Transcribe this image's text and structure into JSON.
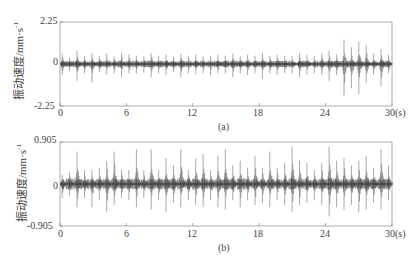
{
  "chart_data": [
    {
      "type": "line",
      "panel": "(a)",
      "caption": "(a)",
      "ylabel": "振动速度/mm·s",
      "ylabel_sup": "-1",
      "xlabel_unit": "(s)",
      "xlim": [
        0,
        30
      ],
      "ylim": [
        -2.25,
        2.25
      ],
      "xticks": [
        0,
        6,
        12,
        18,
        24,
        30
      ],
      "xtick_labels": [
        "0",
        "6",
        "12",
        "18",
        "24",
        "30(s)"
      ],
      "yticks": [
        -2.25,
        0,
        2.25
      ],
      "ytick_labels": [
        "-2.25",
        "0",
        "2.25"
      ],
      "grid": false,
      "description": "Periodic vibration velocity bursts about every 0.67 s; larger spikes near 25-29 s reaching about ±1.3",
      "bursts": {
        "period_s": 0.67,
        "start_s": 0.2,
        "up": [
          0.55,
          0.35,
          0.7,
          0.4,
          0.6,
          0.45,
          0.55,
          0.4,
          0.6,
          0.5,
          0.45,
          0.4,
          0.6,
          0.45,
          0.5,
          0.4,
          0.55,
          0.45,
          0.5,
          0.4,
          0.45,
          0.5,
          0.45,
          0.55,
          0.4,
          0.5,
          0.45,
          0.6,
          0.45,
          0.5,
          0.45,
          0.4,
          0.55,
          0.5,
          0.45,
          0.55,
          0.7,
          0.5,
          1.3,
          0.9,
          1.2,
          1.0,
          0.55,
          0.8,
          0.5
        ],
        "down": [
          0.6,
          0.4,
          0.9,
          0.5,
          1.0,
          0.45,
          0.55,
          0.5,
          0.7,
          0.5,
          0.5,
          0.45,
          0.7,
          0.5,
          0.6,
          0.45,
          0.7,
          0.5,
          0.55,
          0.5,
          0.6,
          0.5,
          0.5,
          0.7,
          0.5,
          0.6,
          0.5,
          0.8,
          0.5,
          0.6,
          0.5,
          0.5,
          0.7,
          0.55,
          0.5,
          0.6,
          0.9,
          0.6,
          1.7,
          1.3,
          1.6,
          1.0,
          0.6,
          1.2,
          0.5
        ],
        "noise": 0.12
      }
    },
    {
      "type": "line",
      "panel": "(b)",
      "caption": "(b)",
      "ylabel": "振动速度/mm·s",
      "ylabel_sup": "-1",
      "xlabel_unit": "(s)",
      "xlim": [
        0,
        30
      ],
      "ylim": [
        -0.905,
        0.905
      ],
      "xticks": [
        0,
        6,
        12,
        18,
        24,
        30
      ],
      "xtick_labels": [
        "0",
        "6",
        "12",
        "18",
        "24",
        "30(s)"
      ],
      "yticks": [
        -0.905,
        0,
        0.905
      ],
      "ytick_labels": [
        "-0.905",
        "0",
        "0.905"
      ],
      "grid": false,
      "description": "Periodic vibration velocity bursts about every 0.67 s with spikes up to about ±0.8 throughout",
      "bursts": {
        "period_s": 0.67,
        "start_s": 0.2,
        "up": [
          0.2,
          0.25,
          0.7,
          0.3,
          0.3,
          0.35,
          0.5,
          0.7,
          0.3,
          0.3,
          0.75,
          0.3,
          0.75,
          0.3,
          0.55,
          0.4,
          0.75,
          0.3,
          0.55,
          0.65,
          0.3,
          0.6,
          0.75,
          0.4,
          0.5,
          0.35,
          0.6,
          0.35,
          0.7,
          0.35,
          0.45,
          0.8,
          0.5,
          0.45,
          0.3,
          0.45,
          0.8,
          0.5,
          0.55,
          0.4,
          0.5,
          0.6,
          0.35,
          0.75,
          0.4
        ],
        "down": [
          0.3,
          0.25,
          0.5,
          0.3,
          0.5,
          0.35,
          0.6,
          0.45,
          0.3,
          0.35,
          0.5,
          0.3,
          0.55,
          0.35,
          0.6,
          0.4,
          0.5,
          0.35,
          0.45,
          0.5,
          0.35,
          0.5,
          0.55,
          0.35,
          0.5,
          0.35,
          0.45,
          0.4,
          0.5,
          0.35,
          0.45,
          0.6,
          0.45,
          0.4,
          0.35,
          0.45,
          0.7,
          0.5,
          0.55,
          0.45,
          0.6,
          0.55,
          0.4,
          0.55,
          0.35
        ],
        "noise": 0.08
      }
    }
  ]
}
